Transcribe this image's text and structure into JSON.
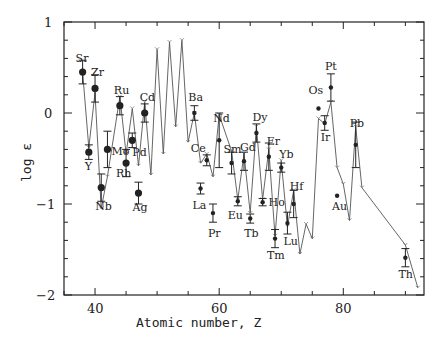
{
  "chart_data": {
    "type": "line",
    "title": "",
    "xlabel": "Atomic number, Z",
    "ylabel": "log ε",
    "xlim": [
      35,
      93
    ],
    "ylim": [
      -2,
      1
    ],
    "x_ticks": [
      40,
      60,
      80
    ],
    "x_minor_step": 5,
    "y_ticks": [
      -2,
      -1,
      0,
      1
    ],
    "y_minor_step": 0.2,
    "grid": false,
    "legend": null,
    "series": [
      {
        "name": "Observed abundances",
        "style": "filled circles with error bars",
        "points": [
          {
            "label": "Sr",
            "z": 38,
            "value": 0.45,
            "err": 0.13
          },
          {
            "label": "Y",
            "z": 39,
            "value": -0.43,
            "err": 0.08
          },
          {
            "label": "Zr",
            "z": 40,
            "value": 0.27,
            "err": 0.15
          },
          {
            "label": "Nb",
            "z": 41,
            "value": -0.82,
            "err": 0.15
          },
          {
            "label": "Mo",
            "z": 42,
            "value": -0.4,
            "err": 0.2
          },
          {
            "label": "Ru",
            "z": 44,
            "value": 0.08,
            "err": 0.1
          },
          {
            "label": "Rh",
            "z": 45,
            "value": -0.55,
            "err": 0.15
          },
          {
            "label": "Pd",
            "z": 46,
            "value": -0.3,
            "err": 0.08
          },
          {
            "label": "Ag",
            "z": 47,
            "value": -0.88,
            "err": 0.12
          },
          {
            "label": "Cd",
            "z": 48,
            "value": 0.0,
            "err": 0.1
          },
          {
            "label": "Ba",
            "z": 56,
            "value": 0.0,
            "err": 0.08
          },
          {
            "label": "La",
            "z": 57,
            "value": -0.83,
            "err": 0.06
          },
          {
            "label": "Ce",
            "z": 58,
            "value": -0.52,
            "err": 0.06
          },
          {
            "label": "Pr",
            "z": 59,
            "value": -1.1,
            "err": 0.1
          },
          {
            "label": "Nd",
            "z": 60,
            "value": -0.3,
            "err": 0.3
          },
          {
            "label": "Sm",
            "z": 62,
            "value": -0.55,
            "err": 0.12
          },
          {
            "label": "Eu",
            "z": 63,
            "value": -0.97,
            "err": 0.05
          },
          {
            "label": "Gd",
            "z": 64,
            "value": -0.53,
            "err": 0.1
          },
          {
            "label": "Tb",
            "z": 65,
            "value": -1.16,
            "err": 0.05
          },
          {
            "label": "Dy",
            "z": 66,
            "value": -0.22,
            "err": 0.1
          },
          {
            "label": "Ho",
            "z": 67,
            "value": -0.98,
            "err": 0.04
          },
          {
            "label": "Er",
            "z": 68,
            "value": -0.48,
            "err": 0.15
          },
          {
            "label": "Tm",
            "z": 69,
            "value": -1.38,
            "err": 0.1
          },
          {
            "label": "Yb",
            "z": 70,
            "value": -0.6,
            "err": 0.05
          },
          {
            "label": "Lu",
            "z": 71,
            "value": -1.21,
            "err": 0.12
          },
          {
            "label": "Hf",
            "z": 72,
            "value": -1.0,
            "err": 0.15
          },
          {
            "label": "Os",
            "z": 76,
            "value": 0.05,
            "err": 0
          },
          {
            "label": "Ir",
            "z": 77,
            "value": -0.11,
            "err": 0.08
          },
          {
            "label": "Pt",
            "z": 78,
            "value": 0.28,
            "err": 0.15
          },
          {
            "label": "Au",
            "z": 79,
            "value": -0.91,
            "err": 0
          },
          {
            "label": "Pb",
            "z": 82,
            "value": -0.35,
            "err": 0.25
          },
          {
            "label": "Th",
            "z": 90,
            "value": -1.59,
            "err": 0.1
          }
        ]
      },
      {
        "name": "Scaled solar r-process curve",
        "style": "thin solid line",
        "x": [
          38,
          39,
          40,
          41,
          42,
          44,
          45,
          46,
          47,
          48,
          49,
          50,
          51,
          52,
          53,
          54,
          55,
          56,
          57,
          58,
          59,
          60,
          62,
          63,
          64,
          65,
          66,
          67,
          68,
          69,
          70,
          71,
          72,
          73,
          74,
          75,
          76,
          77,
          78,
          79,
          80,
          81,
          82,
          83,
          90,
          92
        ],
        "y": [
          0.45,
          -0.38,
          0.22,
          -1.05,
          -0.7,
          0.18,
          -0.45,
          0.05,
          -0.58,
          0.12,
          -0.68,
          0.7,
          -0.45,
          0.78,
          -0.15,
          0.8,
          -0.32,
          0.0,
          -0.55,
          -0.45,
          -0.7,
          -0.02,
          -0.42,
          -0.95,
          -0.45,
          -1.1,
          -0.15,
          -0.95,
          -0.4,
          -1.35,
          -0.52,
          -1.25,
          -0.85,
          -1.55,
          -1.22,
          -1.38,
          -0.06,
          -0.12,
          0.12,
          -0.6,
          -0.78,
          -1.18,
          -0.15,
          -0.82,
          -1.45,
          -1.92
        ]
      }
    ]
  },
  "axes": {
    "y_tick_labels": [
      "1",
      "0",
      "−1",
      "−2"
    ],
    "x_tick_labels": [
      "40",
      "60",
      "80"
    ],
    "xlabel": "Atomic number, Z",
    "ylabel": "log ε"
  },
  "colors": {
    "ink": "#222222",
    "background": "#ffffff"
  }
}
